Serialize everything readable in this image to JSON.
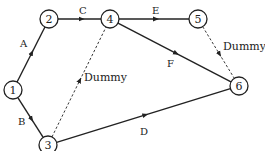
{
  "nodes": [
    {
      "id": "1",
      "x": 13,
      "y": 90
    },
    {
      "id": "2",
      "x": 49,
      "y": 19
    },
    {
      "id": "3",
      "x": 48,
      "y": 145
    },
    {
      "id": "4",
      "x": 110,
      "y": 19
    },
    {
      "id": "5",
      "x": 198,
      "y": 19
    },
    {
      "id": "6",
      "x": 239,
      "y": 86
    }
  ],
  "edges": [
    {
      "label": "A",
      "from": "1",
      "to": "2",
      "dashed": false,
      "lx": 20,
      "ly": 47
    },
    {
      "label": "B",
      "from": "1",
      "to": "3",
      "dashed": false,
      "lx": 18,
      "ly": 125
    },
    {
      "label": "C",
      "from": "2",
      "to": "4",
      "dashed": false,
      "lx": 79,
      "ly": 14
    },
    {
      "label": "E",
      "from": "4",
      "to": "5",
      "dashed": false,
      "lx": 152,
      "ly": 14
    },
    {
      "label": "F",
      "from": "4",
      "to": "6",
      "dashed": false,
      "lx": 167,
      "ly": 67
    },
    {
      "label": "D",
      "from": "3",
      "to": "6",
      "dashed": false,
      "lx": 140,
      "ly": 135
    },
    {
      "label": "Dummy",
      "from": "3",
      "to": "4",
      "dashed": true,
      "lx": 84,
      "ly": 81
    },
    {
      "label": "Dummy",
      "from": "5",
      "to": "6",
      "dashed": true,
      "lx": 223,
      "ly": 50
    }
  ]
}
